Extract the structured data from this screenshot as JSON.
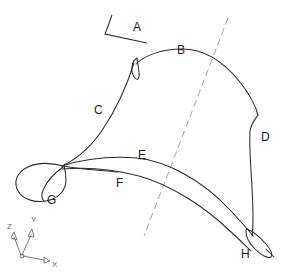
{
  "figure": {
    "kind": "cad-line-drawing",
    "background_color": "#ffffff",
    "line_color": "#2b2b2b",
    "centerline_color": "#9a9a9a",
    "axis_color": "#6e6e6e",
    "width": 285,
    "height": 280
  },
  "labels": {
    "a": "A",
    "b": "B",
    "c": "C",
    "d": "D",
    "e": "E",
    "f": "F",
    "g": "G",
    "h": "H"
  },
  "axis_triad": {
    "x": "X",
    "y": "Y",
    "z": "Z"
  }
}
